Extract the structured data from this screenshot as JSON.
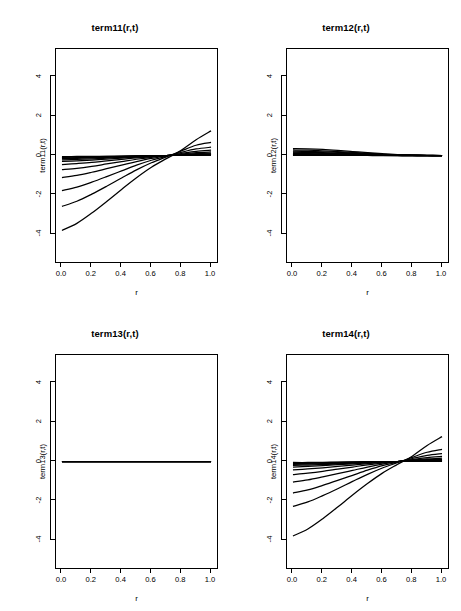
{
  "figure": {
    "width": 461,
    "height": 611,
    "background": "#ffffff",
    "line_color": "#000000",
    "layout": "2x2 grid of line plots"
  },
  "axes": {
    "x": {
      "label": "r",
      "ticks": [
        "0.0",
        "0.2",
        "0.4",
        "0.6",
        "0.8",
        "1.0"
      ],
      "tick_values": [
        0.0,
        0.2,
        0.4,
        0.6,
        0.8,
        1.0
      ],
      "range": [
        -0.04,
        1.04
      ]
    },
    "y": {
      "ticks": [
        "4",
        "2",
        "0",
        "-2",
        "-4"
      ],
      "tick_values": [
        4,
        2,
        0,
        -2,
        -4
      ],
      "range": [
        -5.4,
        5.4
      ]
    }
  },
  "panels": [
    {
      "id": "term11",
      "title": "term11(r,t)",
      "ylabel": "term11(r,t)",
      "xlabel": "r"
    },
    {
      "id": "term12",
      "title": "term12(r,t)",
      "ylabel": "term12(r,t)",
      "xlabel": "r"
    },
    {
      "id": "term13",
      "title": "term13(r,t)",
      "ylabel": "term13(r,t)",
      "xlabel": "r"
    },
    {
      "id": "term14",
      "title": "term14(r,t)",
      "ylabel": "term14(r,t)",
      "xlabel": "r"
    }
  ],
  "chart_data": [
    {
      "type": "line",
      "id": "term11",
      "title": "term11(r,t)",
      "xlabel": "r",
      "ylabel": "term11(r,t)",
      "xlim": [
        -0.04,
        1.04
      ],
      "ylim": [
        -5.4,
        5.4
      ],
      "xticks": [
        0.0,
        0.2,
        0.4,
        0.6,
        0.8,
        1.0
      ],
      "yticks": [
        4,
        2,
        0,
        -2,
        -4
      ],
      "grid": false,
      "legend": "none",
      "x": [
        0.0,
        0.1,
        0.2,
        0.3,
        0.4,
        0.5,
        0.6,
        0.7,
        0.8,
        0.9,
        1.0
      ],
      "series": [
        {
          "name": "t1",
          "values": [
            -3.8,
            -3.44,
            -2.92,
            -2.33,
            -1.72,
            -1.13,
            -0.6,
            -0.16,
            0.26,
            0.8,
            1.25
          ]
        },
        {
          "name": "t2",
          "values": [
            -2.58,
            -2.32,
            -1.96,
            -1.56,
            -1.14,
            -0.73,
            -0.37,
            -0.07,
            0.23,
            0.52,
            0.66
          ]
        },
        {
          "name": "t3",
          "values": [
            -1.78,
            -1.6,
            -1.35,
            -1.07,
            -0.78,
            -0.49,
            -0.24,
            -0.04,
            0.16,
            0.33,
            0.42
          ]
        },
        {
          "name": "t4",
          "values": [
            -1.12,
            -1.01,
            -0.85,
            -0.67,
            -0.49,
            -0.31,
            -0.15,
            -0.02,
            0.1,
            0.21,
            0.27
          ]
        },
        {
          "name": "t5",
          "values": [
            -0.72,
            -0.65,
            -0.55,
            -0.43,
            -0.31,
            -0.19,
            -0.09,
            -0.01,
            0.07,
            0.14,
            0.18
          ]
        },
        {
          "name": "t6",
          "values": [
            -0.46,
            -0.41,
            -0.35,
            -0.27,
            -0.2,
            -0.12,
            -0.06,
            0.0,
            0.05,
            0.09,
            0.12
          ]
        },
        {
          "name": "t7",
          "values": [
            -0.3,
            -0.27,
            -0.23,
            -0.18,
            -0.13,
            -0.08,
            -0.04,
            0.0,
            0.03,
            0.06,
            0.08
          ]
        },
        {
          "name": "t8",
          "values": [
            -0.22,
            -0.2,
            -0.17,
            -0.13,
            -0.09,
            -0.06,
            -0.03,
            0.0,
            0.02,
            0.05,
            0.06
          ]
        },
        {
          "name": "t9",
          "values": [
            -0.16,
            -0.14,
            -0.12,
            -0.09,
            -0.07,
            -0.04,
            -0.02,
            0.0,
            0.02,
            0.03,
            0.04
          ]
        },
        {
          "name": "t10",
          "values": [
            -0.12,
            -0.11,
            -0.09,
            -0.07,
            -0.05,
            -0.03,
            -0.01,
            0.0,
            0.01,
            0.03,
            0.03
          ]
        },
        {
          "name": "t11",
          "values": [
            -0.09,
            -0.08,
            -0.07,
            -0.05,
            -0.04,
            -0.02,
            -0.01,
            0.0,
            0.01,
            0.02,
            0.02
          ]
        },
        {
          "name": "t12",
          "values": [
            -0.06,
            -0.05,
            -0.05,
            -0.04,
            -0.03,
            -0.02,
            -0.01,
            0.0,
            0.01,
            0.01,
            0.02
          ]
        }
      ]
    },
    {
      "type": "line",
      "id": "term12",
      "title": "term12(r,t)",
      "xlabel": "r",
      "ylabel": "term12(r,t)",
      "xlim": [
        -0.04,
        1.04
      ],
      "ylim": [
        -5.4,
        5.4
      ],
      "xticks": [
        0.0,
        0.2,
        0.4,
        0.6,
        0.8,
        1.0
      ],
      "yticks": [
        4,
        2,
        0,
        -2,
        -4
      ],
      "grid": false,
      "legend": "none",
      "x": [
        0.0,
        0.1,
        0.2,
        0.3,
        0.4,
        0.5,
        0.6,
        0.7,
        0.8,
        0.9,
        1.0
      ],
      "series": [
        {
          "name": "t1",
          "values": [
            0.35,
            0.34,
            0.31,
            0.26,
            0.2,
            0.14,
            0.09,
            0.05,
            0.03,
            0.01,
            0.0
          ]
        },
        {
          "name": "t2",
          "values": [
            0.28,
            0.27,
            0.24,
            0.2,
            0.16,
            0.11,
            0.07,
            0.04,
            0.02,
            0.01,
            0.0
          ]
        },
        {
          "name": "t3",
          "values": [
            0.22,
            0.21,
            0.19,
            0.16,
            0.12,
            0.09,
            0.06,
            0.03,
            0.02,
            0.01,
            0.0
          ]
        },
        {
          "name": "t4",
          "values": [
            0.17,
            0.16,
            0.15,
            0.12,
            0.1,
            0.07,
            0.04,
            0.02,
            0.01,
            0.0,
            0.0
          ]
        },
        {
          "name": "t5",
          "values": [
            0.13,
            0.12,
            0.11,
            0.09,
            0.07,
            0.05,
            0.03,
            0.02,
            0.01,
            0.0,
            0.0
          ]
        },
        {
          "name": "t6",
          "values": [
            0.1,
            0.09,
            0.08,
            0.07,
            0.05,
            0.04,
            0.02,
            0.01,
            0.01,
            0.0,
            0.0
          ]
        },
        {
          "name": "t7",
          "values": [
            0.07,
            0.07,
            0.06,
            0.05,
            0.04,
            0.03,
            0.02,
            0.01,
            0.0,
            0.0,
            0.0
          ]
        },
        {
          "name": "t8",
          "values": [
            0.05,
            0.05,
            0.04,
            0.04,
            0.03,
            0.02,
            0.01,
            0.01,
            0.0,
            0.0,
            0.0
          ]
        },
        {
          "name": "t9",
          "values": [
            0.04,
            0.04,
            0.03,
            0.03,
            0.02,
            0.01,
            0.01,
            0.0,
            0.0,
            0.0,
            0.0
          ]
        },
        {
          "name": "t10",
          "values": [
            0.03,
            0.03,
            0.02,
            0.02,
            0.01,
            0.01,
            0.01,
            0.0,
            0.0,
            0.0,
            0.0
          ]
        },
        {
          "name": "t11",
          "values": [
            0.02,
            0.02,
            0.02,
            0.01,
            0.01,
            0.01,
            0.0,
            0.0,
            0.0,
            0.0,
            0.0
          ]
        },
        {
          "name": "t12",
          "values": [
            0.01,
            0.01,
            0.01,
            0.01,
            0.01,
            0.0,
            0.0,
            0.0,
            0.0,
            0.0,
            0.0
          ]
        }
      ]
    },
    {
      "type": "line",
      "id": "term13",
      "title": "term13(r,t)",
      "xlabel": "r",
      "ylabel": "term13(r,t)",
      "xlim": [
        -0.04,
        1.04
      ],
      "ylim": [
        -5.4,
        5.4
      ],
      "xticks": [
        0.0,
        0.2,
        0.4,
        0.6,
        0.8,
        1.0
      ],
      "yticks": [
        4,
        2,
        0,
        -2,
        -4
      ],
      "grid": false,
      "legend": "none",
      "x": [
        0.0,
        0.1,
        0.2,
        0.3,
        0.4,
        0.5,
        0.6,
        0.7,
        0.8,
        0.9,
        1.0
      ],
      "series": [
        {
          "name": "t1",
          "values": [
            0.0,
            0.0,
            0.0,
            0.0,
            0.0,
            0.0,
            0.0,
            0.0,
            0.0,
            0.0,
            0.0
          ]
        },
        {
          "name": "t2",
          "values": [
            0.0,
            0.0,
            0.0,
            0.0,
            0.0,
            0.0,
            0.0,
            0.0,
            0.0,
            0.0,
            0.0
          ]
        },
        {
          "name": "t3",
          "values": [
            0.0,
            0.0,
            0.0,
            0.0,
            0.0,
            0.0,
            0.0,
            0.0,
            0.0,
            0.0,
            0.0
          ]
        },
        {
          "name": "t4",
          "values": [
            0.0,
            0.0,
            0.0,
            0.0,
            0.0,
            0.0,
            0.0,
            0.0,
            0.0,
            0.0,
            0.0
          ]
        },
        {
          "name": "t5",
          "values": [
            0.0,
            0.0,
            0.0,
            0.0,
            0.0,
            0.0,
            0.0,
            0.0,
            0.0,
            0.0,
            0.0
          ]
        },
        {
          "name": "t6",
          "values": [
            0.0,
            0.0,
            0.0,
            0.0,
            0.0,
            0.0,
            0.0,
            0.0,
            0.0,
            0.0,
            0.0
          ]
        }
      ]
    },
    {
      "type": "line",
      "id": "term14",
      "title": "term14(r,t)",
      "xlabel": "r",
      "ylabel": "term14(r,t)",
      "xlim": [
        -0.04,
        1.04
      ],
      "ylim": [
        -5.4,
        5.4
      ],
      "xticks": [
        0.0,
        0.2,
        0.4,
        0.6,
        0.8,
        1.0
      ],
      "yticks": [
        4,
        2,
        0,
        -2,
        -4
      ],
      "grid": false,
      "legend": "none",
      "x": [
        0.0,
        0.1,
        0.2,
        0.3,
        0.4,
        0.5,
        0.6,
        0.7,
        0.8,
        0.9,
        1.0
      ],
      "series": [
        {
          "name": "t1",
          "values": [
            -3.78,
            -3.42,
            -2.9,
            -2.31,
            -1.7,
            -1.12,
            -0.59,
            -0.15,
            0.27,
            0.81,
            1.26
          ]
        },
        {
          "name": "t2",
          "values": [
            -2.28,
            -2.05,
            -1.73,
            -1.38,
            -1.01,
            -0.65,
            -0.33,
            -0.06,
            0.21,
            0.47,
            0.62
          ]
        },
        {
          "name": "t3",
          "values": [
            -1.6,
            -1.44,
            -1.21,
            -0.96,
            -0.7,
            -0.44,
            -0.21,
            -0.03,
            0.15,
            0.31,
            0.4
          ]
        },
        {
          "name": "t4",
          "values": [
            -1.04,
            -0.93,
            -0.78,
            -0.62,
            -0.45,
            -0.28,
            -0.13,
            -0.01,
            0.1,
            0.2,
            0.26
          ]
        },
        {
          "name": "t5",
          "values": [
            -0.66,
            -0.59,
            -0.5,
            -0.39,
            -0.28,
            -0.17,
            -0.08,
            0.0,
            0.07,
            0.13,
            0.17
          ]
        },
        {
          "name": "t6",
          "values": [
            -0.43,
            -0.38,
            -0.32,
            -0.25,
            -0.18,
            -0.11,
            -0.05,
            0.0,
            0.05,
            0.09,
            0.11
          ]
        },
        {
          "name": "t7",
          "values": [
            -0.28,
            -0.25,
            -0.21,
            -0.16,
            -0.12,
            -0.07,
            -0.03,
            0.0,
            0.03,
            0.06,
            0.07
          ]
        },
        {
          "name": "t8",
          "values": [
            -0.2,
            -0.18,
            -0.15,
            -0.12,
            -0.08,
            -0.05,
            -0.02,
            0.0,
            0.02,
            0.04,
            0.05
          ]
        },
        {
          "name": "t9",
          "values": [
            -0.15,
            -0.13,
            -0.11,
            -0.09,
            -0.06,
            -0.04,
            -0.02,
            0.0,
            0.02,
            0.03,
            0.04
          ]
        },
        {
          "name": "t10",
          "values": [
            -0.11,
            -0.1,
            -0.08,
            -0.06,
            -0.05,
            -0.03,
            -0.01,
            0.0,
            0.01,
            0.02,
            0.03
          ]
        },
        {
          "name": "t11",
          "values": [
            -0.08,
            -0.07,
            -0.06,
            -0.05,
            -0.03,
            -0.02,
            -0.01,
            0.0,
            0.01,
            0.02,
            0.02
          ]
        },
        {
          "name": "t12",
          "values": [
            -0.05,
            -0.05,
            -0.04,
            -0.03,
            -0.02,
            -0.01,
            -0.01,
            0.0,
            0.01,
            0.01,
            0.01
          ]
        }
      ]
    }
  ]
}
